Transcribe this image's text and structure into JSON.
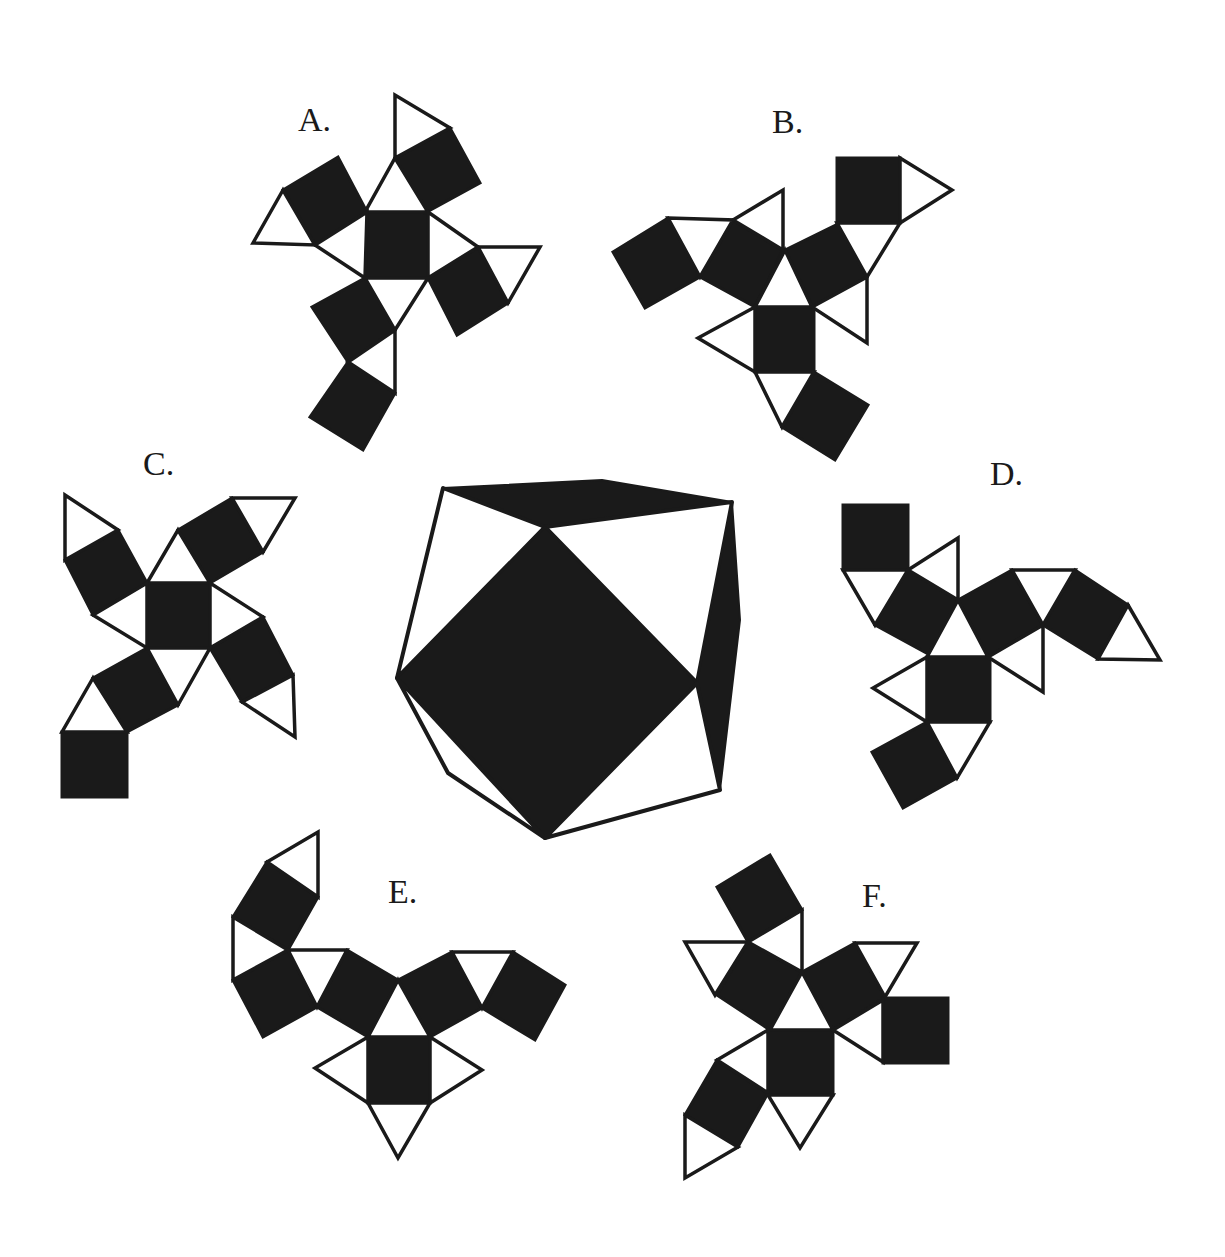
{
  "diagram": {
    "colors": {
      "face_dark": "#1a1a1a",
      "face_light": "#ffffff",
      "background": "#ffffff"
    },
    "solid": {
      "faces": [
        {
          "type": "black",
          "points": "443,488 602,480 732,502 545,527"
        },
        {
          "type": "white",
          "points": "443,488 545,527 397,678"
        },
        {
          "type": "white",
          "points": "545,527 732,502 697,683"
        },
        {
          "type": "black",
          "points": "732,502 740,620 720,790 697,683"
        },
        {
          "type": "black",
          "points": "545,527 697,683 545,838 397,678"
        },
        {
          "type": "white",
          "points": "397,678 545,838 448,773"
        },
        {
          "type": "white",
          "points": "697,683 720,790 545,838"
        }
      ]
    },
    "nets": [
      {
        "id": "A",
        "label": "A.",
        "label_pos": [
          298,
          131
        ],
        "squares": [
          "365,212 428,212 428,278 365,278",
          "395,158 450,128 480,183 425,213",
          "283,190 338,157 367,212 315,245",
          "478,247 508,303 457,335 428,278",
          "365,278 395,330 348,362 312,307",
          "348,362 395,393 363,450 310,417"
        ],
        "triangles": [
          "365,212 428,212 395,158",
          "395,158 395,95 450,128",
          "283,190 253,243 315,245",
          "367,212 315,245 365,278",
          "428,212 478,247 428,278",
          "478,247 540,247 508,303",
          "365,278 428,278 395,330",
          "395,330 348,362 395,393"
        ]
      },
      {
        "id": "B",
        "label": "B.",
        "label_pos": [
          772,
          133
        ],
        "squares": [
          "837,158 900,158 900,223 837,223",
          "785,250 840,223 867,277 812,307",
          "755,307 814,307 814,372 755,372",
          "814,372 868,405 835,460 782,427",
          "733,220 783,250 755,307 700,277",
          "668,218 700,277 645,308 613,252"
        ],
        "triangles": [
          "900,158 952,190 900,223",
          "837,223 900,223 867,277",
          "785,250 812,307 755,307",
          "812,307 867,277 867,343",
          "755,307 698,338 755,372",
          "755,372 814,372 782,427",
          "733,220 783,190 783,250",
          "668,218 733,220 700,277"
        ]
      },
      {
        "id": "C",
        "label": "C.",
        "label_pos": [
          143,
          475
        ],
        "squares": [
          "147,583 210,583 210,648 147,648",
          "178,530 232,498 263,552 210,583",
          "65,560 118,530 147,583 93,615",
          "210,648 263,617 293,675 242,702",
          "147,648 178,705 125,733 93,678",
          "62,732 127,732 127,797 62,797"
        ],
        "triangles": [
          "147,583 210,583 178,530",
          "232,498 295,498 263,552",
          "65,560 65,495 118,530",
          "93,615 147,583 147,648",
          "210,583 263,617 210,648",
          "293,675 295,737 242,702",
          "147,648 210,648 178,705",
          "93,678 62,732 127,732"
        ]
      },
      {
        "id": "D",
        "label": "D.",
        "label_pos": [
          990,
          485
        ],
        "squares": [
          "843,505 908,505 908,570 843,570",
          "908,570 958,600 930,655 875,625",
          "958,600 1012,570 1043,625 988,657",
          "1075,570 1128,605 1098,659 1043,625",
          "927,657 990,657 990,722 927,722",
          "927,722 957,778 903,808 872,752"
        ],
        "triangles": [
          "843,570 908,570 875,625",
          "908,570 958,538 958,600",
          "958,600 988,657 927,657",
          "1012,570 1075,570 1043,625",
          "1128,605 1160,660 1098,659",
          "988,657 1043,625 1043,692",
          "927,657 873,688 927,722",
          "927,722 990,722 957,778"
        ]
      },
      {
        "id": "E",
        "label": "E.",
        "label_pos": [
          388,
          903
        ],
        "squares": [
          "267,862 318,897 288,950 233,917",
          "288,950 317,1007 263,1037 233,980",
          "347,950 398,980 368,1037 317,1007",
          "398,980 452,952 482,1008 430,1037",
          "513,952 565,985 535,1040 482,1008",
          "368,1037 430,1037 430,1103 368,1103"
        ],
        "triangles": [
          "267,862 318,832 318,897",
          "233,917 288,950 233,980",
          "288,950 347,950 317,1007",
          "398,980 430,1037 368,1037",
          "452,952 513,952 482,1008",
          "368,1037 315,1068 368,1103",
          "430,1037 482,1070 430,1103",
          "368,1103 430,1103 398,1158"
        ]
      },
      {
        "id": "F",
        "label": "F.",
        "label_pos": [
          862,
          907
        ],
        "squares": [
          "717,887 770,855 802,910 748,942",
          "748,942 802,972 770,1030 717,995",
          "802,972 855,943 885,997 833,1030",
          "883,998 948,998 948,1063 883,1063",
          "768,1028 833,1028 833,1095 768,1095",
          "717,1060 768,1093 738,1147 685,1115"
        ],
        "triangles": [
          "748,942 802,910 802,972",
          "685,942 748,942 715,995",
          "802,972 833,1030 770,1030",
          "855,943 917,943 885,997",
          "833,1030 883,1000 883,1062",
          "768,1030 717,1060 768,1093",
          "685,1115 738,1147 685,1178",
          "768,1095 833,1095 800,1148"
        ]
      }
    ]
  }
}
